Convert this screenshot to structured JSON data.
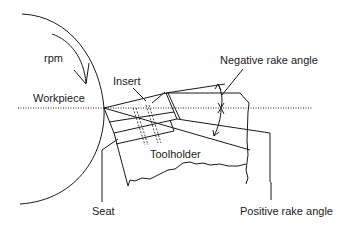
{
  "diagram": {
    "type": "cutting-tool-rake-angle-schematic",
    "labels": {
      "rpm": "rpm",
      "workpiece": "Workpiece",
      "insert": "Insert",
      "negative_rake": "Negative rake angle",
      "toolholder": "Toolholder",
      "seat": "Seat",
      "positive_rake": "Positive rake angle"
    },
    "colors": {
      "line": "#1a1a1a",
      "background": "#ffffff"
    }
  }
}
